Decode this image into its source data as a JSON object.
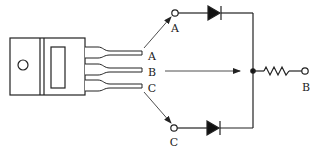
{
  "diagram": {
    "colors": {
      "stroke": "#222222",
      "background": "#ffffff",
      "fill": "#111111"
    },
    "component": {
      "name": "three-lead transistor/regulator package",
      "lead_labels": [
        "A",
        "B",
        "C"
      ]
    },
    "circuit": {
      "terminals": [
        {
          "id": "A",
          "label": "A"
        },
        {
          "id": "B",
          "label": "B"
        },
        {
          "id": "C",
          "label": "C"
        }
      ],
      "elements": [
        {
          "type": "diode",
          "from": "A",
          "to": "junction"
        },
        {
          "type": "diode",
          "from": "C",
          "to": "junction"
        },
        {
          "type": "resistor",
          "from": "junction",
          "to": "B"
        }
      ]
    },
    "arrows": [
      {
        "from": "lead A",
        "to": "terminal A"
      },
      {
        "from": "lead B",
        "to": "junction"
      },
      {
        "from": "lead C",
        "to": "terminal C"
      }
    ]
  }
}
